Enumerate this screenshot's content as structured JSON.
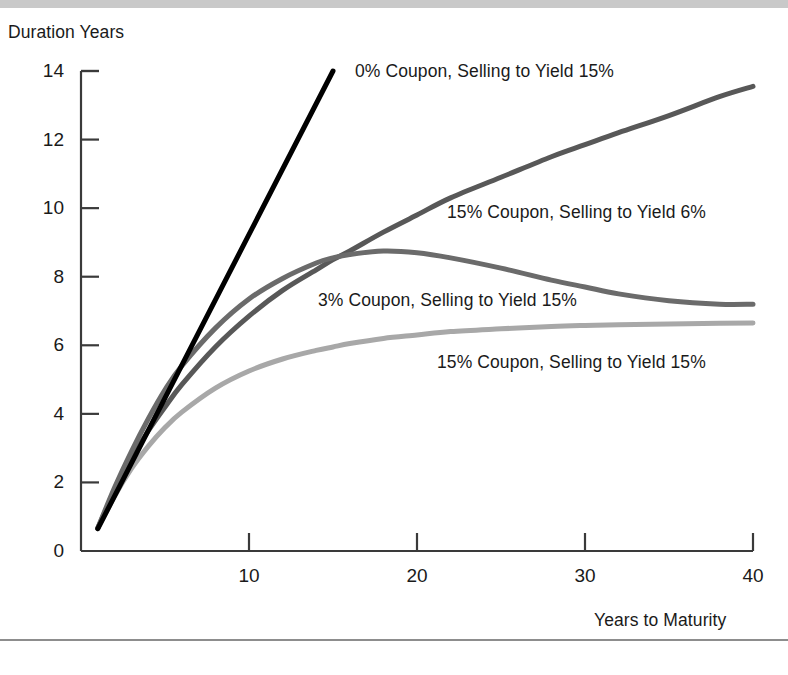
{
  "figure": {
    "background": "#ffffff",
    "top_bar_color": "#c9c9c9",
    "bottom_rule_color": "#8d8d8d"
  },
  "chart_data": {
    "type": "line",
    "title": "",
    "xlabel": "Years to Maturity",
    "ylabel": "Duration Years",
    "xlim": [
      0,
      40
    ],
    "ylim": [
      0,
      14
    ],
    "xticks": [
      "10",
      "20",
      "30",
      "40"
    ],
    "xtick_values": [
      10,
      20,
      30,
      40
    ],
    "yticks": [
      "0",
      "2",
      "4",
      "6",
      "8",
      "10",
      "12",
      "14"
    ],
    "ytick_values": [
      0,
      2,
      4,
      6,
      8,
      10,
      12,
      14
    ],
    "grid": false,
    "legend_position": "inline-annotations",
    "x": [
      1,
      2,
      3,
      4,
      5,
      6,
      8,
      10,
      12,
      14,
      15,
      16,
      18,
      20,
      22,
      25,
      28,
      30,
      32,
      35,
      38,
      40
    ],
    "series": [
      {
        "name": "0% Coupon, Selling to Yield 15%",
        "color": "#000000",
        "width": 5,
        "x": [
          1,
          15
        ],
        "values": [
          0.65,
          14.0
        ],
        "label_x": 355,
        "label_y": 62
      },
      {
        "name": "15% Coupon, Selling to Yield 6%",
        "color": "#585858",
        "width": 5,
        "values": [
          0.67,
          1.75,
          2.7,
          3.5,
          4.2,
          4.85,
          5.95,
          6.85,
          7.6,
          8.2,
          8.5,
          8.75,
          9.3,
          9.8,
          10.3,
          10.9,
          11.5,
          11.85,
          12.2,
          12.7,
          13.25,
          13.55
        ],
        "label_x": 447,
        "label_y": 203
      },
      {
        "name": "3% Coupon, Selling to Yield 15%",
        "color": "#6b6b6b",
        "width": 5,
        "values": [
          0.67,
          1.85,
          2.9,
          3.85,
          4.7,
          5.4,
          6.5,
          7.35,
          7.95,
          8.4,
          8.55,
          8.65,
          8.75,
          8.7,
          8.55,
          8.25,
          7.9,
          7.7,
          7.5,
          7.3,
          7.2,
          7.2
        ],
        "label_x": 318,
        "label_y": 291
      },
      {
        "name": "15% Coupon, Selling to Yield 15%",
        "color": "#a8a8a8",
        "width": 5,
        "values": [
          0.65,
          1.6,
          2.4,
          3.05,
          3.6,
          4.05,
          4.75,
          5.25,
          5.6,
          5.85,
          5.95,
          6.05,
          6.2,
          6.3,
          6.4,
          6.48,
          6.55,
          6.58,
          6.6,
          6.62,
          6.64,
          6.65
        ],
        "label_x": 437,
        "label_y": 353
      }
    ]
  }
}
